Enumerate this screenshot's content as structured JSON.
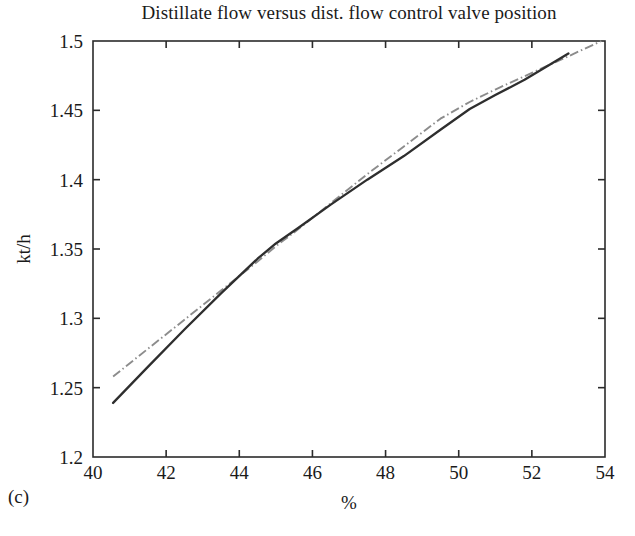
{
  "figure": {
    "panel_label": "(c)",
    "background_color": "#ffffff"
  },
  "chart_data": {
    "type": "line",
    "title": "Distillate flow versus dist. flow control valve position",
    "xlabel": "%",
    "ylabel": "kt/h",
    "xlim": [
      40,
      54
    ],
    "ylim": [
      1.2,
      1.5
    ],
    "xticks": [
      40,
      42,
      44,
      46,
      48,
      50,
      52,
      54
    ],
    "xtick_labels": [
      "40",
      "42",
      "44",
      "46",
      "48",
      "50",
      "52",
      "54"
    ],
    "yticks": [
      1.2,
      1.25,
      1.3,
      1.35,
      1.4,
      1.45,
      1.5
    ],
    "ytick_labels": [
      "1.2",
      "1.25",
      "1.3",
      "1.35",
      "1.4",
      "1.45",
      "1.5"
    ],
    "grid": false,
    "legend": "none",
    "series": [
      {
        "name": "measured",
        "style": "solid",
        "color": "#2e2e2e",
        "x": [
          40.55,
          41.5,
          42.5,
          43.5,
          44.5,
          45.0,
          45.6,
          46.5,
          47.5,
          48.5,
          49.5,
          50.3,
          51.0,
          51.8,
          53.0
        ],
        "y": [
          1.239,
          1.265,
          1.292,
          1.318,
          1.343,
          1.354,
          1.365,
          1.382,
          1.4,
          1.417,
          1.436,
          1.451,
          1.461,
          1.472,
          1.491
        ]
      },
      {
        "name": "model",
        "style": "dash-dot",
        "color": "#8c8c8c",
        "x": [
          40.55,
          41.5,
          42.5,
          43.5,
          44.5,
          45.0,
          45.6,
          46.5,
          47.5,
          48.5,
          49.5,
          50.3,
          51.0,
          52.0,
          53.0,
          53.9
        ],
        "y": [
          1.258,
          1.278,
          1.299,
          1.32,
          1.341,
          1.352,
          1.364,
          1.383,
          1.404,
          1.424,
          1.444,
          1.456,
          1.465,
          1.477,
          1.489,
          1.5
        ]
      }
    ]
  }
}
